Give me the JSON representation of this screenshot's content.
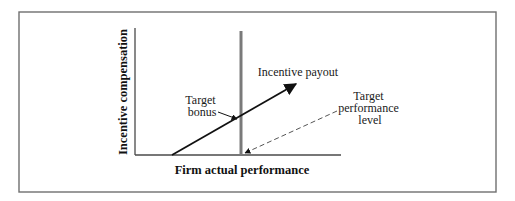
{
  "diagram": {
    "type": "incentive-compensation-schematic",
    "frame": {
      "x": 19,
      "y": 12,
      "width": 477,
      "height": 180,
      "stroke": "#6f6f6f"
    },
    "axes": {
      "x_label": "Firm actual performance",
      "y_label": "Incentive compensation",
      "origin": [
        135,
        155
      ],
      "x_end": 341,
      "y_top": 28,
      "stroke": "#4a4a4a"
    },
    "target_line": {
      "x": 241,
      "y_top": 31,
      "y_bottom": 155,
      "color": "#7a7a7a"
    },
    "payout_line": {
      "label": "Incentive payout",
      "from": [
        172,
        155
      ],
      "to": [
        296,
        84
      ],
      "color": "#111111"
    },
    "annotations": {
      "target_bonus": {
        "lines": [
          "Target",
          "bonus"
        ],
        "arrow_from": [
          218,
          112
        ],
        "arrow_to": [
          237,
          119
        ]
      },
      "target_performance": {
        "lines": [
          "Target",
          "performance",
          "level"
        ],
        "arrow_from": [
          337,
          111
        ],
        "arrow_to": [
          244,
          154
        ],
        "style": "dashed",
        "color": "#555555"
      }
    }
  }
}
